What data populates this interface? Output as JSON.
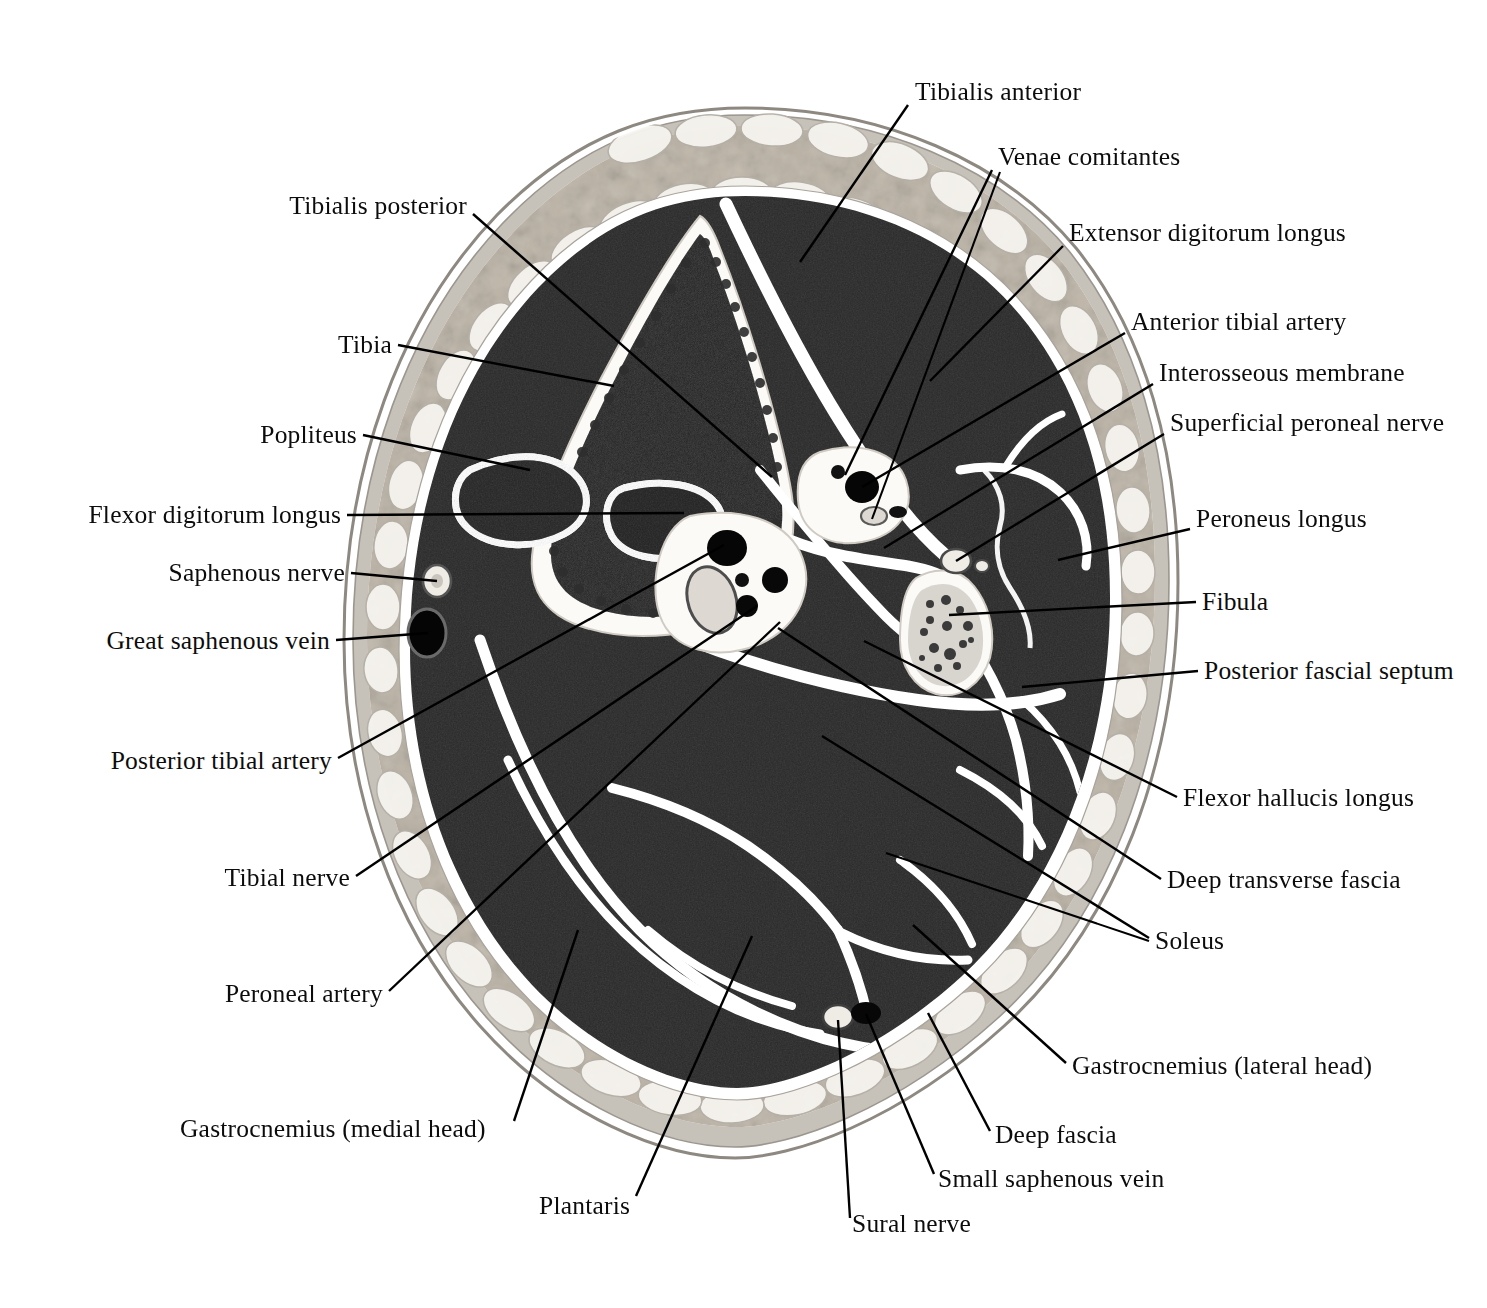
{
  "figure": {
    "view": "axial cross-section",
    "modality": "anatomical cryosection photograph, grayscale"
  },
  "palette": {
    "background": "#ffffff",
    "skin_outer": "#b9b4ac",
    "subcutaneous_fat": "#dedad2",
    "fat_lobule_light": "#f3f1ec",
    "deep_fascia": "#ffffff",
    "muscle": "#6d6d6d",
    "muscle_dark": "#5c5c5c",
    "bone_cortex": "#fbfaf7",
    "bone_marrow": "#6a6a6a",
    "bone_trabecular": "#3a3a3a",
    "vessel_lumen": "#000000",
    "nerve": "#d8d6cf",
    "leader_line": "#000000",
    "label_text": "#0c0c0c"
  },
  "labels": [
    {
      "id": "tibialis-anterior",
      "text": "Tibialis anterior",
      "align": "left",
      "x": 915,
      "y": 97,
      "leader": [
        [
          908,
          105
        ],
        [
          800,
          262
        ]
      ]
    },
    {
      "id": "venae-comitantes",
      "text": "Venae comitantes",
      "align": "left",
      "x": 998,
      "y": 162,
      "leader": [
        [
          992,
          170
        ],
        [
          845,
          475
        ]
      ],
      "leader2": [
        [
          1000,
          172
        ],
        [
          872,
          519
        ]
      ]
    },
    {
      "id": "extensor-digitorum-longus",
      "text": "Extensor digitorum longus",
      "align": "left",
      "x": 1069,
      "y": 238,
      "leader": [
        [
          1063,
          246
        ],
        [
          930,
          381
        ]
      ]
    },
    {
      "id": "anterior-tibial-artery",
      "text": "Anterior tibial artery",
      "align": "left",
      "x": 1131,
      "y": 327,
      "leader": [
        [
          1125,
          333
        ],
        [
          862,
          487
        ]
      ]
    },
    {
      "id": "interosseous-membrane",
      "text": "Interosseous membrane",
      "align": "left",
      "x": 1159,
      "y": 378,
      "leader": [
        [
          1153,
          384
        ],
        [
          884,
          548
        ]
      ]
    },
    {
      "id": "superficial-peroneal-nerve",
      "text": "Superficial peroneal nerve",
      "align": "left",
      "x": 1170,
      "y": 428,
      "leader": [
        [
          1164,
          434
        ],
        [
          956,
          561
        ]
      ]
    },
    {
      "id": "peroneus-longus",
      "text": "Peroneus longus",
      "align": "left",
      "x": 1196,
      "y": 524,
      "leader": [
        [
          1190,
          529
        ],
        [
          1058,
          560
        ]
      ]
    },
    {
      "id": "fibula",
      "text": "Fibula",
      "align": "left",
      "x": 1202,
      "y": 607,
      "leader": [
        [
          1196,
          602
        ],
        [
          949,
          615
        ]
      ]
    },
    {
      "id": "posterior-fascial-septum",
      "text": "Posterior fascial septum",
      "align": "left",
      "x": 1204,
      "y": 676,
      "leader": [
        [
          1198,
          671
        ],
        [
          1022,
          687
        ]
      ]
    },
    {
      "id": "flexor-hallucis-longus",
      "text": "Flexor hallucis longus",
      "align": "left",
      "x": 1183,
      "y": 803,
      "leader": [
        [
          1177,
          797
        ],
        [
          864,
          641
        ]
      ]
    },
    {
      "id": "deep-transverse-fascia",
      "text": "Deep transverse fascia",
      "align": "left",
      "x": 1167,
      "y": 885,
      "leader": [
        [
          1161,
          879
        ],
        [
          778,
          628
        ]
      ]
    },
    {
      "id": "soleus",
      "text": "Soleus",
      "align": "left",
      "x": 1155,
      "y": 946,
      "leader": [
        [
          1149,
          938
        ],
        [
          822,
          736
        ]
      ],
      "leader2": [
        [
          1149,
          941
        ],
        [
          886,
          853
        ]
      ]
    },
    {
      "id": "gastrocnemius-lateral",
      "text": "Gastrocnemius (lateral head)",
      "align": "left",
      "x": 1072,
      "y": 1071,
      "leader": [
        [
          1066,
          1063
        ],
        [
          913,
          925
        ]
      ]
    },
    {
      "id": "deep-fascia",
      "text": "Deep fascia",
      "align": "left",
      "x": 995,
      "y": 1140,
      "leader": [
        [
          990,
          1131
        ],
        [
          928,
          1013
        ]
      ]
    },
    {
      "id": "small-saphenous-vein",
      "text": "Small saphenous vein",
      "align": "left",
      "x": 938,
      "y": 1184,
      "leader": [
        [
          934,
          1174
        ],
        [
          866,
          1014
        ]
      ]
    },
    {
      "id": "sural-nerve",
      "text": "Sural nerve",
      "align": "left",
      "x": 852,
      "y": 1229,
      "leader": [
        [
          850,
          1218
        ],
        [
          838,
          1020
        ]
      ]
    },
    {
      "id": "plantaris",
      "text": "Plantaris",
      "align": "left",
      "x": 539,
      "y": 1211,
      "leader": [
        [
          636,
          1196
        ],
        [
          752,
          936
        ]
      ]
    },
    {
      "id": "gastrocnemius-medial",
      "text": "Gastrocnemius (medial head)",
      "align": "left",
      "x": 180,
      "y": 1134,
      "leader": [
        [
          514,
          1121
        ],
        [
          578,
          930
        ]
      ]
    },
    {
      "id": "peroneal-artery",
      "text": "Peroneal artery",
      "align": "right",
      "x": 383,
      "y": 999,
      "leader": [
        [
          389,
          991
        ],
        [
          780,
          622
        ]
      ]
    },
    {
      "id": "tibial-nerve",
      "text": "Tibial nerve",
      "align": "right",
      "x": 350,
      "y": 883,
      "leader": [
        [
          356,
          876
        ],
        [
          757,
          606
        ]
      ]
    },
    {
      "id": "posterior-tibial-artery",
      "text": "Posterior tibial artery",
      "align": "right",
      "x": 332,
      "y": 766,
      "leader": [
        [
          338,
          758
        ],
        [
          724,
          545
        ]
      ]
    },
    {
      "id": "great-saphenous-vein",
      "text": "Great saphenous vein",
      "align": "right",
      "x": 330,
      "y": 646,
      "leader": [
        [
          336,
          640
        ],
        [
          428,
          633
        ]
      ]
    },
    {
      "id": "saphenous-nerve",
      "text": "Saphenous nerve",
      "align": "right",
      "x": 345,
      "y": 578,
      "leader": [
        [
          351,
          573
        ],
        [
          437,
          581
        ]
      ]
    },
    {
      "id": "flexor-digitorum-longus",
      "text": "Flexor digitorum longus",
      "align": "right",
      "x": 341,
      "y": 520,
      "leader": [
        [
          347,
          515
        ],
        [
          684,
          513
        ]
      ]
    },
    {
      "id": "popliteus",
      "text": "Popliteus",
      "align": "right",
      "x": 357,
      "y": 440,
      "leader": [
        [
          363,
          435
        ],
        [
          530,
          470
        ]
      ]
    },
    {
      "id": "tibia",
      "text": "Tibia",
      "align": "right",
      "x": 392,
      "y": 350,
      "leader": [
        [
          398,
          345
        ],
        [
          614,
          386
        ]
      ]
    },
    {
      "id": "tibialis-posterior",
      "text": "Tibialis posterior",
      "align": "right",
      "x": 467,
      "y": 211,
      "leader": [
        [
          473,
          214
        ],
        [
          772,
          477
        ]
      ]
    }
  ]
}
